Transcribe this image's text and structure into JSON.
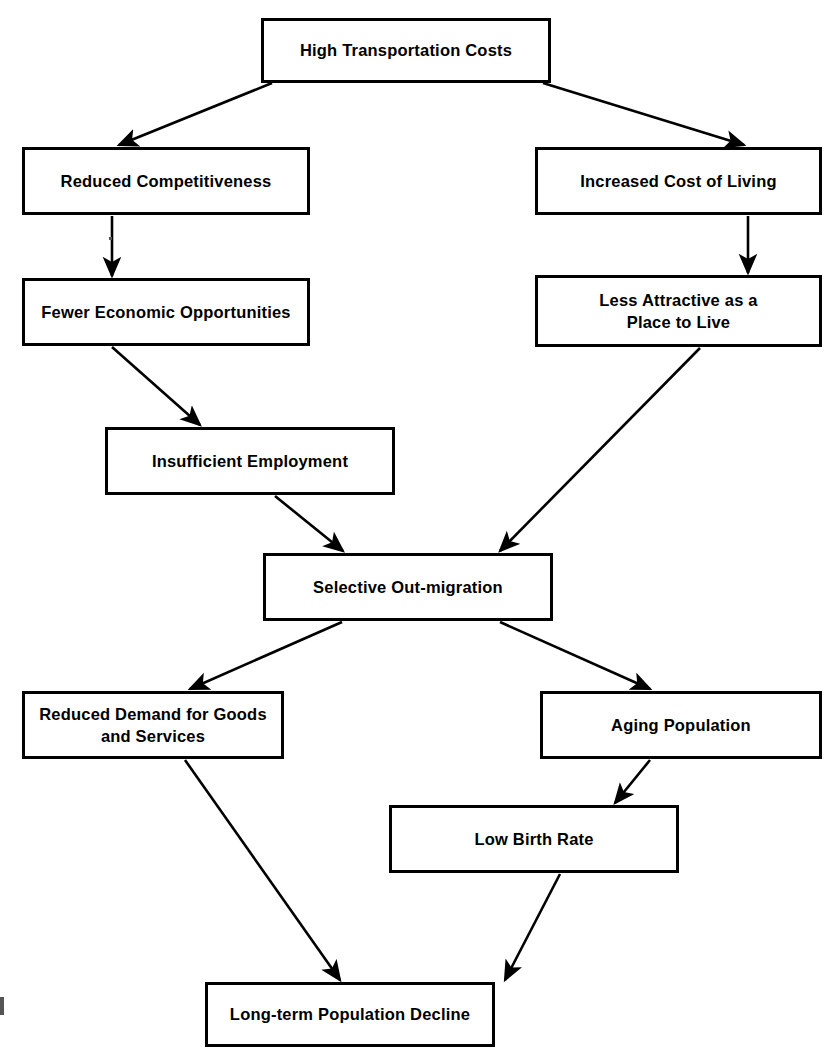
{
  "diagram": {
    "type": "flowchart",
    "orientation": "top-down",
    "background_color": "#ffffff",
    "line_color": "#000000",
    "text_color": "#000000",
    "nodes": [
      {
        "id": "high-transportation-costs",
        "label": "High Transportation Costs",
        "x": 261,
        "y": 18,
        "w": 290,
        "h": 65
      },
      {
        "id": "reduced-competitiveness",
        "label": "Reduced Competitiveness",
        "x": 22,
        "y": 147,
        "w": 288,
        "h": 68
      },
      {
        "id": "increased-cost-of-living",
        "label": "Increased Cost of Living",
        "x": 535,
        "y": 147,
        "w": 287,
        "h": 68
      },
      {
        "id": "fewer-economic-opportunities",
        "label": "Fewer Economic Opportunities",
        "x": 22,
        "y": 278,
        "w": 288,
        "h": 68
      },
      {
        "id": "less-attractive-place-to-live",
        "label": "Less Attractive as a\nPlace to Live",
        "x": 535,
        "y": 275,
        "w": 287,
        "h": 72
      },
      {
        "id": "insufficient-employment",
        "label": "Insufficient Employment",
        "x": 105,
        "y": 427,
        "w": 290,
        "h": 68
      },
      {
        "id": "selective-out-migration",
        "label": "Selective Out-migration",
        "x": 263,
        "y": 553,
        "w": 290,
        "h": 68
      },
      {
        "id": "reduced-demand-goods-services",
        "label": "Reduced Demand for Goods\nand Services",
        "x": 22,
        "y": 691,
        "w": 262,
        "h": 68
      },
      {
        "id": "aging-population",
        "label": "Aging Population",
        "x": 540,
        "y": 691,
        "w": 282,
        "h": 68
      },
      {
        "id": "low-birth-rate",
        "label": "Low Birth Rate",
        "x": 389,
        "y": 805,
        "w": 290,
        "h": 68
      },
      {
        "id": "long-term-population-decline",
        "label": "Long-term Population Decline",
        "x": 205,
        "y": 982,
        "w": 290,
        "h": 65
      }
    ],
    "edges": [
      {
        "id": "edge-costs-to-competitiveness",
        "from": "high-transportation-costs",
        "to": "reduced-competitiveness",
        "x1": 272,
        "y1": 83,
        "x2": 119,
        "y2": 145
      },
      {
        "id": "edge-costs-to-cost-of-living",
        "from": "high-transportation-costs",
        "to": "increased-cost-of-living",
        "x1": 543,
        "y1": 83,
        "x2": 744,
        "y2": 145
      },
      {
        "id": "edge-competitiveness-to-opportunities",
        "from": "reduced-competitiveness",
        "to": "fewer-economic-opportunities",
        "x1": 112,
        "y1": 216,
        "x2": 112,
        "y2": 276
      },
      {
        "id": "edge-cost-of-living-to-attractive",
        "from": "increased-cost-of-living",
        "to": "less-attractive-place-to-live",
        "x1": 748,
        "y1": 216,
        "x2": 748,
        "y2": 273
      },
      {
        "id": "edge-opportunities-to-employment",
        "from": "fewer-economic-opportunities",
        "to": "insufficient-employment",
        "x1": 112,
        "y1": 347,
        "x2": 200,
        "y2": 425
      },
      {
        "id": "edge-employment-to-outmigration",
        "from": "insufficient-employment",
        "to": "selective-out-migration",
        "x1": 275,
        "y1": 496,
        "x2": 343,
        "y2": 551
      },
      {
        "id": "edge-attractive-to-outmigration",
        "from": "less-attractive-place-to-live",
        "to": "selective-out-migration",
        "x1": 700,
        "y1": 348,
        "x2": 500,
        "y2": 551
      },
      {
        "id": "edge-outmigration-to-demand",
        "from": "selective-out-migration",
        "to": "reduced-demand-goods-services",
        "x1": 342,
        "y1": 622,
        "x2": 190,
        "y2": 689
      },
      {
        "id": "edge-outmigration-to-aging",
        "from": "selective-out-migration",
        "to": "aging-population",
        "x1": 500,
        "y1": 622,
        "x2": 650,
        "y2": 689
      },
      {
        "id": "edge-aging-to-birth-rate",
        "from": "aging-population",
        "to": "low-birth-rate",
        "x1": 650,
        "y1": 760,
        "x2": 615,
        "y2": 803
      },
      {
        "id": "edge-demand-to-decline",
        "from": "reduced-demand-goods-services",
        "to": "long-term-population-decline",
        "x1": 185,
        "y1": 760,
        "x2": 340,
        "y2": 980
      },
      {
        "id": "edge-birth-rate-to-decline",
        "from": "low-birth-rate",
        "to": "long-term-population-decline",
        "x1": 560,
        "y1": 874,
        "x2": 505,
        "y2": 980
      }
    ]
  }
}
